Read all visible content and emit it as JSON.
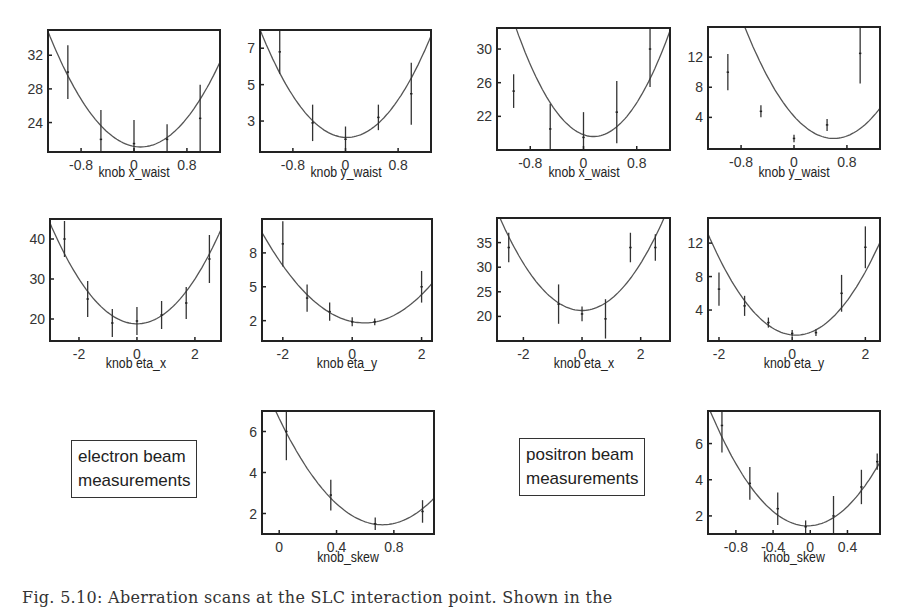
{
  "figure": {
    "caption": "Fig. 5.10: Aberration scans at the SLC interaction point. Shown in the",
    "legends": {
      "electron": [
        "electron beam",
        "measurements"
      ],
      "positron": [
        "positron beam",
        "measurements"
      ]
    }
  },
  "chart_data": [
    {
      "id": "e-xwaist",
      "beam": "electron",
      "type": "scatter",
      "fit": "parabola",
      "xlabel": "knob x_waist",
      "ylabel": "",
      "xlim": [
        -1.3,
        1.3
      ],
      "ylim": [
        20.5,
        35
      ],
      "xticks": [
        -0.8,
        0,
        0.8
      ],
      "yticks": [
        24,
        28,
        32
      ],
      "points": [
        {
          "x": -1.0,
          "y": 30,
          "err": 3.2
        },
        {
          "x": -0.5,
          "y": 22,
          "err": 3.5
        },
        {
          "x": 0.0,
          "y": 21.5,
          "err": 2.8
        },
        {
          "x": 0.5,
          "y": 22,
          "err": 1.8
        },
        {
          "x": 1.0,
          "y": 24.5,
          "err": 4.0
        }
      ],
      "fit_coeffs": {
        "a": 7.0,
        "b": 0.1,
        "c": 21.1
      }
    },
    {
      "id": "e-ywaist",
      "beam": "electron",
      "type": "scatter",
      "fit": "parabola",
      "xlabel": "knob y_waist",
      "ylabel": "",
      "xlim": [
        -1.3,
        1.3
      ],
      "ylim": [
        1.3,
        8.0
      ],
      "xticks": [
        -0.8,
        0,
        0.8
      ],
      "yticks": [
        3,
        5,
        7
      ],
      "points": [
        {
          "x": -1.0,
          "y": 6.8,
          "err": 1.2
        },
        {
          "x": -0.5,
          "y": 2.9,
          "err": 1.0
        },
        {
          "x": 0.0,
          "y": 2.0,
          "err": 0.7
        },
        {
          "x": 0.5,
          "y": 3.2,
          "err": 0.7
        },
        {
          "x": 1.0,
          "y": 4.5,
          "err": 1.7
        }
      ],
      "fit_coeffs": {
        "a": 3.4,
        "b": 0.02,
        "c": 2.1
      }
    },
    {
      "id": "p-xwaist",
      "beam": "positron",
      "type": "scatter",
      "fit": "parabola",
      "xlabel": "knob x_waist",
      "ylabel": "",
      "xlim": [
        -1.3,
        1.3
      ],
      "ylim": [
        18,
        32.5
      ],
      "xticks": [
        -0.8,
        0,
        0.8
      ],
      "yticks": [
        22,
        26,
        30
      ],
      "points": [
        {
          "x": -1.05,
          "y": 25,
          "err": 2.0
        },
        {
          "x": -0.5,
          "y": 20.5,
          "err": 3.0
        },
        {
          "x": 0.0,
          "y": 19.5,
          "err": 3.0
        },
        {
          "x": 0.5,
          "y": 22.5,
          "err": 3.7
        },
        {
          "x": 1.0,
          "y": 30,
          "err": 4.5
        }
      ],
      "fit_coeffs": {
        "a": 9.5,
        "b": 0.15,
        "c": 19.6
      }
    },
    {
      "id": "p-ywaist",
      "beam": "positron",
      "type": "scatter",
      "fit": "parabola",
      "xlabel": "knob y_waist",
      "ylabel": "",
      "xlim": [
        -1.3,
        1.3
      ],
      "ylim": [
        -0.2,
        16
      ],
      "xticks": [
        -0.8,
        0,
        0.8
      ],
      "yticks": [
        4,
        8,
        12
      ],
      "points": [
        {
          "x": -1.0,
          "y": 10,
          "err": 2.4
        },
        {
          "x": -0.5,
          "y": 4.8,
          "err": 0.8
        },
        {
          "x": 0.0,
          "y": 1.2,
          "err": 0.5
        },
        {
          "x": 0.5,
          "y": 3.0,
          "err": 0.8
        },
        {
          "x": 1.0,
          "y": 12.5,
          "err": 4.0
        }
      ],
      "fit_coeffs": {
        "a": 8.2,
        "b": 0.6,
        "c": 1.2
      }
    },
    {
      "id": "e-etax",
      "beam": "electron",
      "type": "scatter",
      "fit": "parabola",
      "xlabel": "knob eta_x",
      "ylabel": "",
      "xlim": [
        -3.0,
        2.9
      ],
      "ylim": [
        14.5,
        45
      ],
      "xticks": [
        -2,
        0,
        2
      ],
      "yticks": [
        20,
        30,
        40
      ],
      "points": [
        {
          "x": -2.5,
          "y": 40,
          "err": 4.5
        },
        {
          "x": -1.7,
          "y": 25,
          "err": 4.5
        },
        {
          "x": -0.85,
          "y": 19,
          "err": 3.5
        },
        {
          "x": 0.0,
          "y": 19.5,
          "err": 3.5
        },
        {
          "x": 0.85,
          "y": 21,
          "err": 3.5
        },
        {
          "x": 1.7,
          "y": 24,
          "err": 4.0
        },
        {
          "x": 2.5,
          "y": 35,
          "err": 6.0
        }
      ],
      "fit_coeffs": {
        "a": 2.8,
        "b": 0.0,
        "c": 18.8
      }
    },
    {
      "id": "e-etay",
      "beam": "electron",
      "type": "scatter",
      "fit": "parabola",
      "xlabel": "knob eta_y",
      "ylabel": "",
      "xlim": [
        -2.6,
        2.3
      ],
      "ylim": [
        0.2,
        11
      ],
      "xticks": [
        -2,
        0,
        2
      ],
      "yticks": [
        2,
        5,
        8
      ],
      "points": [
        {
          "x": -2.0,
          "y": 8.8,
          "err": 2.0
        },
        {
          "x": -1.3,
          "y": 4.0,
          "err": 1.2
        },
        {
          "x": -0.65,
          "y": 2.8,
          "err": 0.8
        },
        {
          "x": 0.0,
          "y": 1.9,
          "err": 0.4
        },
        {
          "x": 0.65,
          "y": 1.9,
          "err": 0.3
        },
        {
          "x": 2.0,
          "y": 5.0,
          "err": 1.4
        }
      ],
      "fit_coeffs": {
        "a": 0.92,
        "b": 0.35,
        "c": 1.8
      }
    },
    {
      "id": "p-etax",
      "beam": "positron",
      "type": "scatter",
      "fit": "parabola",
      "xlabel": "knob eta_x",
      "ylabel": "",
      "xlim": [
        -2.9,
        3.0
      ],
      "ylim": [
        15,
        40
      ],
      "xticks": [
        -2,
        0,
        2
      ],
      "yticks": [
        20,
        25,
        30,
        35
      ],
      "points": [
        {
          "x": -2.5,
          "y": 34,
          "err": 3.0
        },
        {
          "x": -0.8,
          "y": 22.5,
          "err": 4.0
        },
        {
          "x": 0.0,
          "y": 20.5,
          "err": 1.5
        },
        {
          "x": 0.8,
          "y": 19.5,
          "err": 4.0
        },
        {
          "x": 1.65,
          "y": 34,
          "err": 3.0
        },
        {
          "x": 2.5,
          "y": 34,
          "err": 2.7
        }
      ],
      "fit_coeffs": {
        "a": 2.4,
        "b": 0.0,
        "c": 21.2
      }
    },
    {
      "id": "p-etay",
      "beam": "positron",
      "type": "scatter",
      "fit": "parabola",
      "xlabel": "knob eta_y",
      "ylabel": "",
      "xlim": [
        -2.3,
        2.4
      ],
      "ylim": [
        0.3,
        15
      ],
      "xticks": [
        -2,
        0,
        2
      ],
      "yticks": [
        4,
        8,
        12
      ],
      "points": [
        {
          "x": -2.0,
          "y": 6.5,
          "err": 2.0
        },
        {
          "x": -1.3,
          "y": 4.5,
          "err": 1.2
        },
        {
          "x": -0.65,
          "y": 2.5,
          "err": 0.6
        },
        {
          "x": 0.0,
          "y": 1.2,
          "err": 0.4
        },
        {
          "x": 0.65,
          "y": 1.3,
          "err": 0.4
        },
        {
          "x": 1.35,
          "y": 6.0,
          "err": 2.2
        },
        {
          "x": 2.0,
          "y": 11.5,
          "err": 2.5
        }
      ],
      "fit_coeffs": {
        "a": 2.1,
        "b": 0.1,
        "c": 1.0
      }
    },
    {
      "id": "e-skew",
      "beam": "electron",
      "type": "scatter",
      "fit": "parabola",
      "xlabel": "knob_skew",
      "ylabel": "",
      "xlim": [
        -0.12,
        1.08
      ],
      "ylim": [
        1.0,
        7.0
      ],
      "xticks": [
        0,
        0.4,
        0.8
      ],
      "yticks": [
        2,
        4,
        6
      ],
      "points": [
        {
          "x": 0.05,
          "y": 6.0,
          "err": 1.4
        },
        {
          "x": 0.36,
          "y": 2.9,
          "err": 0.75
        },
        {
          "x": 0.67,
          "y": 1.5,
          "err": 0.3
        },
        {
          "x": 1.0,
          "y": 2.1,
          "err": 0.55
        }
      ],
      "fit_coeffs": {
        "a": 10.0,
        "b": 0.72,
        "c": 1.45
      }
    },
    {
      "id": "p-skew",
      "beam": "positron",
      "type": "scatter",
      "fit": "parabola",
      "xlabel": "knob_skew",
      "ylabel": "",
      "xlim": [
        -1.1,
        0.75
      ],
      "ylim": [
        1.0,
        7.8
      ],
      "xticks": [
        -0.8,
        -0.4,
        0,
        0.4
      ],
      "yticks": [
        2,
        4,
        6
      ],
      "points": [
        {
          "x": -0.95,
          "y": 7.0,
          "err": 1.5
        },
        {
          "x": -0.65,
          "y": 3.8,
          "err": 0.9
        },
        {
          "x": -0.35,
          "y": 2.4,
          "err": 0.9
        },
        {
          "x": -0.05,
          "y": 1.4,
          "err": 0.35
        },
        {
          "x": 0.25,
          "y": 2.0,
          "err": 1.1
        },
        {
          "x": 0.55,
          "y": 3.6,
          "err": 0.95
        },
        {
          "x": 0.72,
          "y": 5.0,
          "err": 0.45
        }
      ],
      "fit_coeffs": {
        "a": 5.8,
        "b": -0.03,
        "c": 1.45
      }
    }
  ]
}
